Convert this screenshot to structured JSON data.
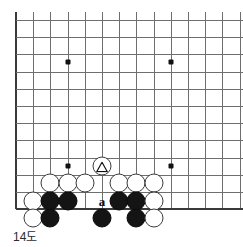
{
  "figure": {
    "caption": "14도",
    "kind": "go-board-diagram",
    "colors": {
      "background": "#ffffff",
      "gridline": "#6e6e6e",
      "board_edge": "#3a3a3a",
      "black_stone": "#141414",
      "white_stone": "#ffffff",
      "stone_outline": "#3b3b3b",
      "label_text": "#111111",
      "caption_text": "#2b2b2b"
    }
  },
  "board": {
    "origin_x": 16,
    "origin_y": 20,
    "spacing": 17.2,
    "cols": 14,
    "rows": 12,
    "left_edge_col": 0,
    "bottom_edge_row": 11,
    "top_open": true,
    "right_open": true,
    "star_points": [
      {
        "col": 3,
        "row": 2.45
      },
      {
        "col": 9,
        "row": 2.45
      },
      {
        "col": 3,
        "row": 8.5
      },
      {
        "col": 9,
        "row": 8.5
      }
    ]
  },
  "stones": [
    {
      "id": "w-marked",
      "color": "white",
      "col": 5,
      "row": 8.5,
      "mark": "triangle",
      "label": ""
    },
    {
      "id": "w-r9-c2",
      "color": "white",
      "col": 2,
      "row": 9.5,
      "mark": "",
      "label": ""
    },
    {
      "id": "w-r9-c3",
      "color": "white",
      "col": 3,
      "row": 9.5,
      "mark": "",
      "label": ""
    },
    {
      "id": "w-r9-c4",
      "color": "white",
      "col": 4,
      "row": 9.5,
      "mark": "",
      "label": ""
    },
    {
      "id": "w-r9-c6",
      "color": "white",
      "col": 6,
      "row": 9.5,
      "mark": "",
      "label": ""
    },
    {
      "id": "w-r9-c7",
      "color": "white",
      "col": 7,
      "row": 9.5,
      "mark": "",
      "label": ""
    },
    {
      "id": "w-r9-c8",
      "color": "white",
      "col": 8,
      "row": 9.5,
      "mark": "",
      "label": ""
    },
    {
      "id": "w-r10-c1",
      "color": "white",
      "col": 1,
      "row": 10.5,
      "mark": "",
      "label": ""
    },
    {
      "id": "b-r10-c2",
      "color": "black",
      "col": 2,
      "row": 10.5,
      "mark": "",
      "label": ""
    },
    {
      "id": "b-r10-c3",
      "color": "black",
      "col": 3,
      "row": 10.5,
      "mark": "",
      "label": ""
    },
    {
      "id": "b-r10-c6",
      "color": "black",
      "col": 6,
      "row": 10.5,
      "mark": "",
      "label": ""
    },
    {
      "id": "b-r10-c7",
      "color": "black",
      "col": 7,
      "row": 10.5,
      "mark": "",
      "label": ""
    },
    {
      "id": "w-r10-c8",
      "color": "white",
      "col": 8,
      "row": 10.5,
      "mark": "",
      "label": ""
    },
    {
      "id": "w-r11-c1",
      "color": "white",
      "col": 1,
      "row": 11.5,
      "mark": "",
      "label": ""
    },
    {
      "id": "b-r11-c2",
      "color": "black",
      "col": 2,
      "row": 11.5,
      "mark": "",
      "label": ""
    },
    {
      "id": "b-r11-c5",
      "color": "black",
      "col": 5,
      "row": 11.5,
      "mark": "",
      "label": ""
    },
    {
      "id": "b-r11-c7",
      "color": "black",
      "col": 7,
      "row": 11.5,
      "mark": "",
      "label": ""
    },
    {
      "id": "w-r11-c8",
      "color": "white",
      "col": 8,
      "row": 11.5,
      "mark": "",
      "label": ""
    }
  ],
  "point_labels": [
    {
      "id": "point-a",
      "text": "a",
      "col": 5,
      "row": 10.5
    }
  ]
}
